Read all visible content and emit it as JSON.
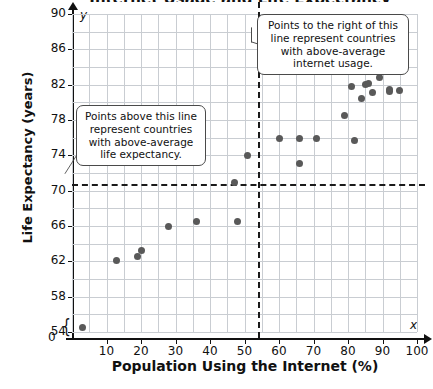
{
  "title": "Internet Usage and Life Expectancy",
  "chart_data": {
    "type": "scatter",
    "title": "Internet Usage and Life Expectancy",
    "xlabel": "Population Using the Internet (%)",
    "ylabel": "Life Expectancy (years)",
    "xlim": [
      0,
      100
    ],
    "ylim": [
      54,
      90
    ],
    "x_ticks": [
      10,
      20,
      30,
      40,
      50,
      60,
      70,
      80,
      90,
      100
    ],
    "y_ticks": [
      54,
      58,
      62,
      66,
      70,
      74,
      78,
      82,
      86,
      90
    ],
    "x_gridline_step": 5,
    "y_gridline_step": 2,
    "y_axis_break": true,
    "grid": true,
    "legend": "none",
    "mean_life_expectancy_line": 70.8,
    "mean_internet_usage_line": 54,
    "points": [
      {
        "x": 3,
        "y": 54.5
      },
      {
        "x": 13,
        "y": 62.1
      },
      {
        "x": 19,
        "y": 62.6
      },
      {
        "x": 20,
        "y": 63.2
      },
      {
        "x": 28,
        "y": 66.0
      },
      {
        "x": 29,
        "y": 73.2
      },
      {
        "x": 36,
        "y": 66.5
      },
      {
        "x": 47,
        "y": 70.9
      },
      {
        "x": 48,
        "y": 66.5
      },
      {
        "x": 51,
        "y": 74.0
      },
      {
        "x": 60,
        "y": 75.9
      },
      {
        "x": 66,
        "y": 75.9
      },
      {
        "x": 66,
        "y": 73.1
      },
      {
        "x": 71,
        "y": 75.9
      },
      {
        "x": 79,
        "y": 78.5
      },
      {
        "x": 82,
        "y": 75.7
      },
      {
        "x": 81,
        "y": 81.8
      },
      {
        "x": 84,
        "y": 80.4
      },
      {
        "x": 85,
        "y": 82.0
      },
      {
        "x": 86,
        "y": 82.1
      },
      {
        "x": 87,
        "y": 81.1
      },
      {
        "x": 89,
        "y": 82.8
      },
      {
        "x": 92,
        "y": 81.5
      },
      {
        "x": 92,
        "y": 81.2
      },
      {
        "x": 95,
        "y": 81.3
      }
    ]
  },
  "annotations": {
    "left_callout": "Points above this line represent countries with above-average life expectancy.",
    "right_callout": "Points to the right of this line represent countries with above-average internet usage."
  },
  "axis": {
    "y_symbol": "y",
    "x_symbol": "x",
    "zero_label": "0",
    "break_glyph": "{"
  }
}
